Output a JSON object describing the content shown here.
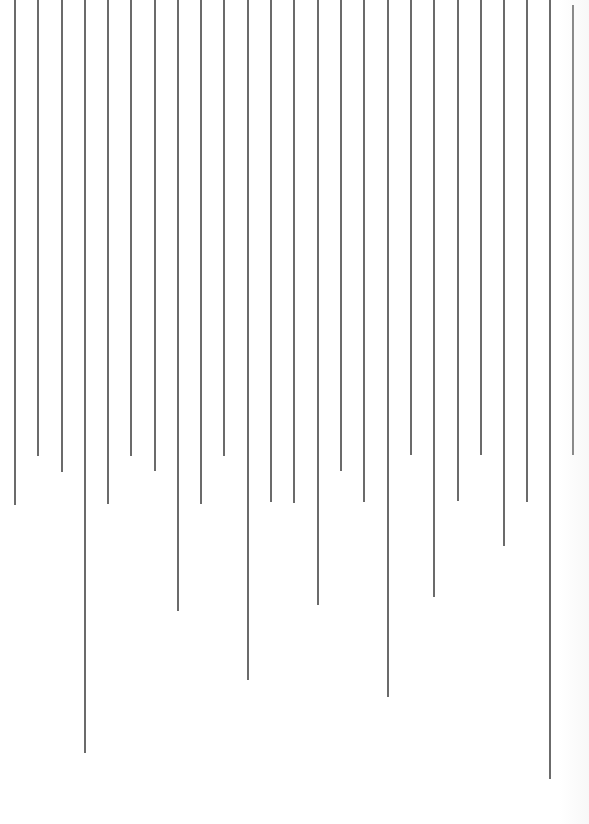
{
  "artwork": {
    "background": "#ffffff",
    "line_color": "#6b6b6b",
    "line_count": 25,
    "lines": [
      {
        "x": 15,
        "y1": 0,
        "y2": 505
      },
      {
        "x": 38,
        "y1": 0,
        "y2": 456
      },
      {
        "x": 62,
        "y1": 0,
        "y2": 472
      },
      {
        "x": 85,
        "y1": 0,
        "y2": 753
      },
      {
        "x": 108,
        "y1": 0,
        "y2": 504
      },
      {
        "x": 131,
        "y1": 0,
        "y2": 456
      },
      {
        "x": 155,
        "y1": 0,
        "y2": 471
      },
      {
        "x": 178,
        "y1": 0,
        "y2": 611
      },
      {
        "x": 201,
        "y1": 0,
        "y2": 504
      },
      {
        "x": 224,
        "y1": 0,
        "y2": 456
      },
      {
        "x": 248,
        "y1": 0,
        "y2": 680
      },
      {
        "x": 271,
        "y1": 0,
        "y2": 502
      },
      {
        "x": 294,
        "y1": 0,
        "y2": 503
      },
      {
        "x": 318,
        "y1": 0,
        "y2": 605
      },
      {
        "x": 341,
        "y1": 0,
        "y2": 471
      },
      {
        "x": 364,
        "y1": 0,
        "y2": 502
      },
      {
        "x": 388,
        "y1": 0,
        "y2": 697
      },
      {
        "x": 411,
        "y1": 0,
        "y2": 455
      },
      {
        "x": 434,
        "y1": 0,
        "y2": 597
      },
      {
        "x": 458,
        "y1": 0,
        "y2": 501
      },
      {
        "x": 481,
        "y1": 0,
        "y2": 455
      },
      {
        "x": 504,
        "y1": 0,
        "y2": 546
      },
      {
        "x": 527,
        "y1": 0,
        "y2": 502
      },
      {
        "x": 550,
        "y1": 0,
        "y2": 779
      },
      {
        "x": 573,
        "y1": 5,
        "y2": 455
      }
    ]
  }
}
